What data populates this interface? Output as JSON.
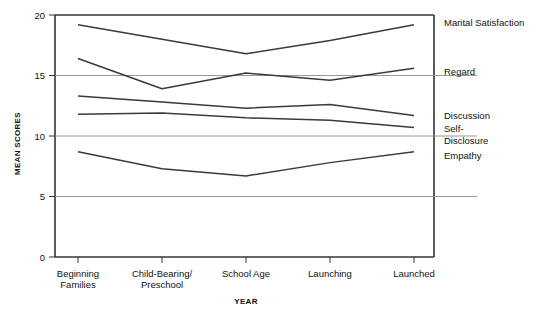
{
  "chart_data": {
    "type": "line",
    "title": "",
    "xlabel": "YEAR",
    "ylabel": "MEAN SCORES",
    "categories": [
      "Beginning\nFamilies",
      "Child-Bearing/\nPreschool",
      "School Age",
      "Launching",
      "Launched"
    ],
    "categories_flat": [
      "Beginning Families",
      "Child-Bearing/Preschool",
      "School Age",
      "Launching",
      "Launched"
    ],
    "ylim": [
      0,
      20
    ],
    "yticks": [
      0,
      5,
      10,
      15,
      20
    ],
    "ytick_labels": [
      "0",
      "5",
      "10",
      "15",
      "20"
    ],
    "grid": "horizontal",
    "legend_position": "right-inline",
    "line_color": "#3a3a3a",
    "series": [
      {
        "name": "Marital Satisfaction",
        "values": [
          19.2,
          18.0,
          16.8,
          17.9,
          19.2
        ]
      },
      {
        "name": "Regard",
        "values": [
          16.4,
          13.9,
          15.2,
          14.6,
          15.6
        ]
      },
      {
        "name": "Discussion",
        "values": [
          13.3,
          12.8,
          12.3,
          12.6,
          11.7
        ]
      },
      {
        "name": "Self-Disclosure",
        "values": [
          11.8,
          11.9,
          11.5,
          11.3,
          10.7
        ]
      },
      {
        "name": "Empathy",
        "values": [
          8.7,
          7.3,
          6.7,
          7.8,
          8.7
        ]
      }
    ],
    "series_labels": [
      {
        "text": "Marital Satisfaction",
        "y_value": 19.4
      },
      {
        "text": "Regard",
        "y_value": 15.3
      },
      {
        "text": "Discussion",
        "y_value": 11.7
      },
      {
        "text": "Self-",
        "y_value": 10.6
      },
      {
        "text": "Disclosure",
        "y_value": 9.6
      },
      {
        "text": "Empathy",
        "y_value": 8.4
      }
    ]
  },
  "axes": {
    "y_title": "MEAN SCORES",
    "x_title": "YEAR"
  }
}
